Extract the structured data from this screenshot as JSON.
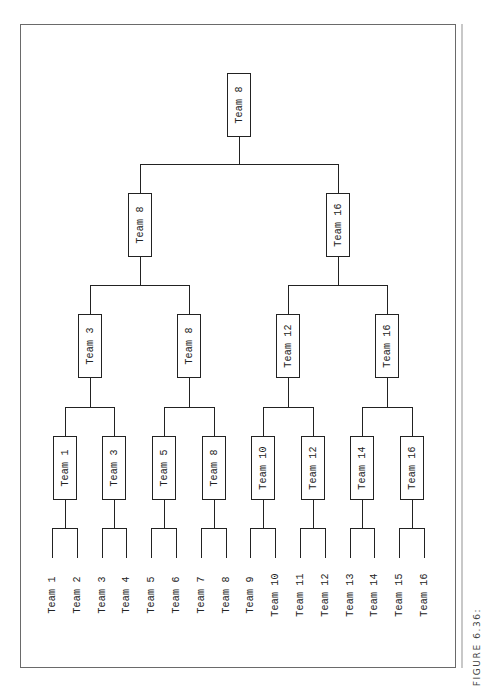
{
  "caption": "FIGURE 6.36:",
  "bracket": {
    "champion": "Team 8",
    "semifinals": [
      "Team 8",
      "Team 16"
    ],
    "quarterfinals": [
      "Team 3",
      "Team 8",
      "Team 12",
      "Team 16"
    ],
    "round1_winners": [
      "Team 1",
      "Team 3",
      "Team 5",
      "Team 8",
      "Team 10",
      "Team 12",
      "Team 14",
      "Team 16"
    ],
    "entrants": [
      "Team 1",
      "Team 2",
      "Team 3",
      "Team 4",
      "Team 5",
      "Team 6",
      "Team 7",
      "Team 8",
      "Team 9",
      "Team 10",
      "Team 11",
      "Team 12",
      "Team 13",
      "Team 14",
      "Team 15",
      "Team 16"
    ]
  },
  "colors": {
    "line": "#222222",
    "frame": "#6a6a6a",
    "outer_rule": "#c8c8c8"
  }
}
